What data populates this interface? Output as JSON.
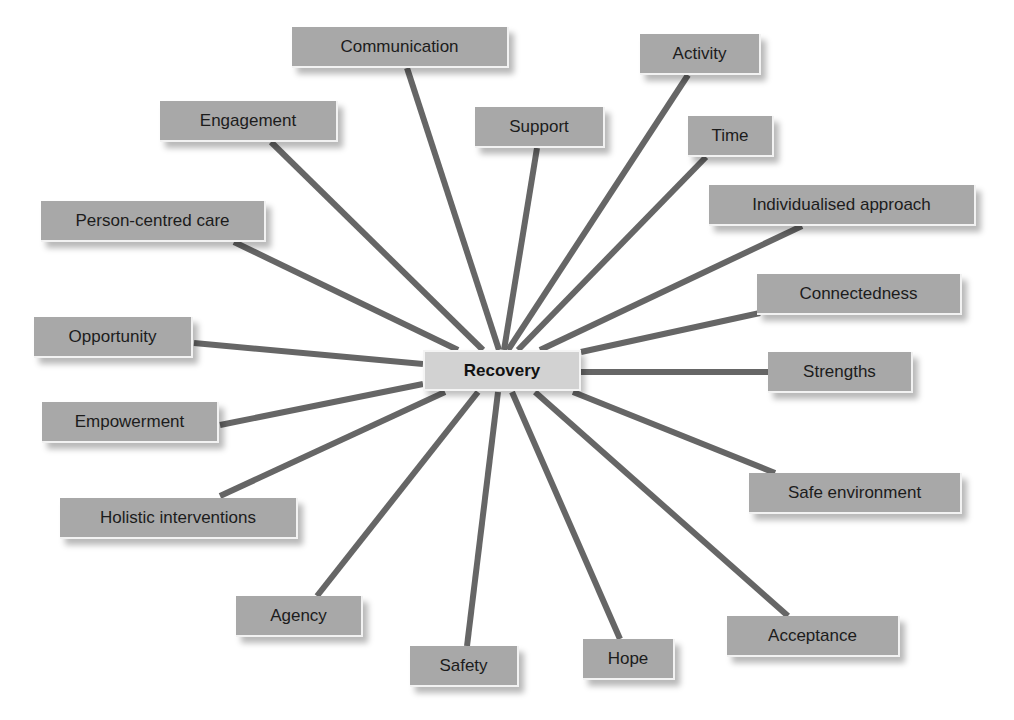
{
  "diagram": {
    "type": "radial-concept-map",
    "line_color": "#666666",
    "line_width": 6,
    "node_fill": "#a8a8a8",
    "center_fill": "#d2d2d2",
    "center": {
      "label": "Recovery",
      "x": 423,
      "y": 350,
      "w": 158,
      "h": 41
    },
    "nodes": [
      {
        "id": "communication",
        "label": "Communication",
        "x": 292,
        "y": 27,
        "w": 217,
        "h": 41,
        "line": [
          407,
          68,
          499,
          350
        ]
      },
      {
        "id": "activity",
        "label": "Activity",
        "x": 640,
        "y": 34,
        "w": 121,
        "h": 41,
        "line": [
          688,
          75,
          508,
          350
        ]
      },
      {
        "id": "engagement",
        "label": "Engagement",
        "x": 160,
        "y": 101,
        "w": 178,
        "h": 41,
        "line": [
          271,
          142,
          483,
          350
        ]
      },
      {
        "id": "support",
        "label": "Support",
        "x": 475,
        "y": 107,
        "w": 130,
        "h": 41,
        "line": [
          537,
          148,
          504,
          350
        ]
      },
      {
        "id": "time",
        "label": "Time",
        "x": 688,
        "y": 116,
        "w": 86,
        "h": 41,
        "line": [
          706,
          157,
          518,
          350
        ]
      },
      {
        "id": "individualised-approach",
        "label": "Individualised approach",
        "x": 709,
        "y": 185,
        "w": 267,
        "h": 41,
        "line": [
          802,
          226,
          540,
          350
        ]
      },
      {
        "id": "person-centred-care",
        "label": "Person-centred care",
        "x": 41,
        "y": 201,
        "w": 225,
        "h": 41,
        "line": [
          234,
          242,
          458,
          350
        ]
      },
      {
        "id": "connectedness",
        "label": "Connectedness",
        "x": 757,
        "y": 274,
        "w": 205,
        "h": 41,
        "line": [
          760,
          313,
          581,
          352
        ]
      },
      {
        "id": "opportunity",
        "label": "Opportunity",
        "x": 34,
        "y": 317,
        "w": 159,
        "h": 41,
        "line": [
          194,
          343,
          423,
          364
        ]
      },
      {
        "id": "strengths",
        "label": "Strengths",
        "x": 768,
        "y": 352,
        "w": 145,
        "h": 41,
        "line": [
          581,
          372,
          768,
          372
        ]
      },
      {
        "id": "empowerment",
        "label": "Empowerment",
        "x": 42,
        "y": 402,
        "w": 177,
        "h": 41,
        "line": [
          220,
          425,
          423,
          384
        ]
      },
      {
        "id": "safe-environment",
        "label": "Safe environment",
        "x": 749,
        "y": 473,
        "w": 213,
        "h": 41,
        "line": [
          775,
          473,
          573,
          392
        ]
      },
      {
        "id": "holistic-interventions",
        "label": "Holistic interventions",
        "x": 60,
        "y": 498,
        "w": 238,
        "h": 41,
        "line": [
          220,
          496,
          445,
          392
        ]
      },
      {
        "id": "agency",
        "label": "Agency",
        "x": 236,
        "y": 596,
        "w": 127,
        "h": 41,
        "line": [
          317,
          596,
          478,
          392
        ]
      },
      {
        "id": "acceptance",
        "label": "Acceptance",
        "x": 727,
        "y": 616,
        "w": 173,
        "h": 41,
        "line": [
          788,
          616,
          535,
          392
        ]
      },
      {
        "id": "hope",
        "label": "Hope",
        "x": 583,
        "y": 639,
        "w": 92,
        "h": 41,
        "line": [
          620,
          639,
          512,
          392
        ]
      },
      {
        "id": "safety",
        "label": "Safety",
        "x": 410,
        "y": 646,
        "w": 109,
        "h": 41,
        "line": [
          467,
          646,
          498,
          392
        ]
      }
    ]
  }
}
